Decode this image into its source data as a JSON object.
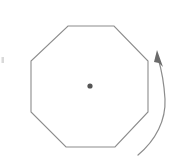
{
  "figure": {
    "title": "Regular octagon with center point and rotation arrow",
    "canvas": {
      "width": 178,
      "height": 165,
      "background": "#ffffff"
    },
    "colors": {
      "outline_stroke": "#8c8c8c",
      "center_dot_fill": "#555555",
      "arrow_stroke": "#8c8c8c",
      "arrow_head_fill": "#6b6b6b",
      "speck_fill": "#d9d9d9"
    },
    "shape": {
      "name": "regular-octagon",
      "sides": 8,
      "orientation": "flat-top",
      "fill": "none",
      "stroke_width": 1.1,
      "bounds": {
        "left": 31,
        "top": 26,
        "right": 148,
        "bottom": 147
      },
      "vertices": [
        [
          68,
          26
        ],
        [
          114,
          26
        ],
        [
          148,
          61
        ],
        [
          148,
          112
        ],
        [
          115,
          147
        ],
        [
          66,
          147
        ],
        [
          31,
          112
        ],
        [
          31,
          61
        ]
      ],
      "path": "M68,26 L114,26 L148,61 L148,112 L115,147 L66,147 L31,112 L31,61 Z"
    },
    "center_point": {
      "name": "center-of-rotation",
      "cx": 90,
      "cy": 86,
      "r": 2.6
    },
    "rotation_arrow": {
      "name": "rotation-arrow",
      "direction": "counterclockwise",
      "description": "curved arrow on the right side sweeping upward, arrowhead at top pointing up-left",
      "arc_path": "M138,155 C156,140 166,120 165,99 C164,82 161,68 158,58",
      "head_points": "157,50 163,67 159,63 154,62",
      "tail": [
        138,
        155
      ],
      "tip": [
        157,
        50
      ]
    },
    "artifacts": [
      {
        "name": "left-edge-speck",
        "x": 1.5,
        "y": 57,
        "width": 2.5,
        "height": 6
      }
    ]
  }
}
